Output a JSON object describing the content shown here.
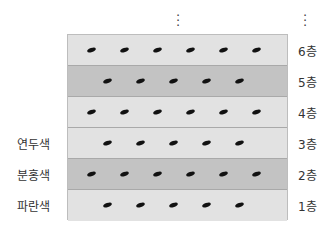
{
  "diagram": {
    "continuation": "⋮",
    "layers": [
      {
        "floor": "6층",
        "shade": "light",
        "grains": 6,
        "offset": "wide",
        "color_label": ""
      },
      {
        "floor": "5층",
        "shade": "dark",
        "grains": 5,
        "offset": "narrow",
        "color_label": ""
      },
      {
        "floor": "4층",
        "shade": "light",
        "grains": 6,
        "offset": "wide",
        "color_label": ""
      },
      {
        "floor": "3층",
        "shade": "light",
        "grains": 5,
        "offset": "narrow",
        "color_label": "연두색"
      },
      {
        "floor": "2층",
        "shade": "dark",
        "grains": 6,
        "offset": "wide",
        "color_label": "분홍색"
      },
      {
        "floor": "1층",
        "shade": "light",
        "grains": 5,
        "offset": "narrow",
        "color_label": "파란색"
      }
    ],
    "colors": {
      "light_band": "#e2e2e2",
      "dark_band": "#c3c3c3",
      "grain": "#111111"
    }
  }
}
